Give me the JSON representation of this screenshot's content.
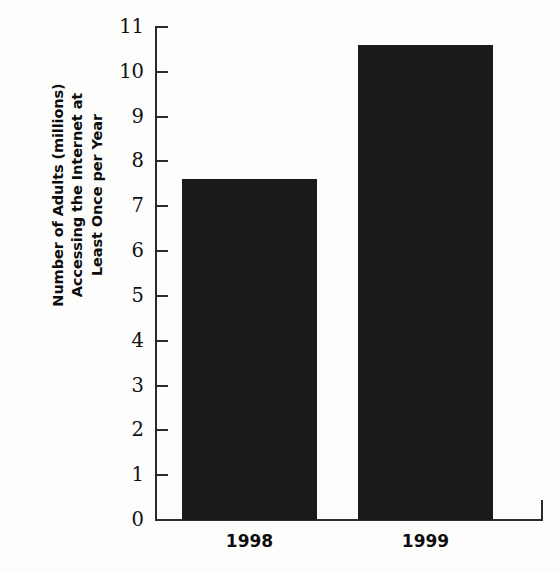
{
  "chart_data": {
    "type": "bar",
    "title": "",
    "subtitle": "",
    "xlabel": "",
    "ylabel": "Number of Adults (millions) Accessing the Internet at Least Once per Year",
    "ylabel_lines": [
      "Number of Adults (millions)",
      "Accessing the Internet at",
      "Least Once per Year"
    ],
    "categories": [
      "1998",
      "1999"
    ],
    "values": [
      7.6,
      10.6
    ],
    "series": [
      {
        "name": "Adults accessing the Internet",
        "values": [
          7.6,
          10.6
        ]
      }
    ],
    "ylim": [
      0,
      11
    ],
    "ytick_step": 1,
    "ytick_labels": [
      "11",
      "10",
      "9",
      "8",
      "7",
      "6",
      "5",
      "4",
      "3",
      "2",
      "1",
      "0"
    ],
    "grid": false,
    "legend": "none",
    "bar_color": "#1a1a1a",
    "axis_color": "#2b2b2b",
    "background_color": "#fdfdfb"
  }
}
